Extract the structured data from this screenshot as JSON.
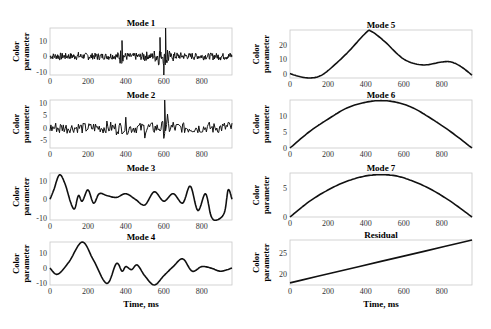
{
  "figure": {
    "xlabel": "Time, ms",
    "ylabel_line1": "Color",
    "ylabel_line2": "parameter",
    "xticks": [
      "0",
      "200",
      "400",
      "600",
      "800"
    ]
  },
  "chart_data": [
    {
      "type": "line",
      "title": "Mode 1",
      "xlabel": "",
      "ylabel": "Color parameter",
      "xlim": [
        0,
        960
      ],
      "ylim": [
        -12,
        18
      ],
      "yticks": [
        -10,
        0,
        10
      ],
      "xticks": [
        0,
        200,
        400,
        600,
        800
      ],
      "description": "high-frequency oscillation around 0, spikes up to ~18 near 610 ms and down to ~-12 near 580-610 ms",
      "x": [
        0,
        50,
        100,
        150,
        200,
        250,
        300,
        350,
        380,
        400,
        450,
        500,
        550,
        580,
        600,
        610,
        650,
        700,
        750,
        800,
        850,
        900,
        950
      ],
      "y": [
        0,
        5,
        -3,
        4,
        -5,
        4,
        -4,
        3,
        10,
        -6,
        5,
        -7,
        6,
        12,
        -12,
        18,
        -6,
        4,
        -3,
        3,
        -4,
        4,
        2
      ]
    },
    {
      "type": "line",
      "title": "Mode 2",
      "xlabel": "",
      "ylabel": "Color parameter",
      "xlim": [
        0,
        960
      ],
      "ylim": [
        -8,
        11
      ],
      "yticks": [
        -5,
        0,
        5,
        10
      ],
      "xticks": [
        0,
        200,
        400,
        600,
        800
      ],
      "description": "medium-frequency oscillation, amplitude ~5, spike to ~11 at 605 ms",
      "x": [
        0,
        50,
        100,
        150,
        200,
        250,
        300,
        350,
        400,
        450,
        500,
        550,
        600,
        605,
        620,
        650,
        700,
        750,
        800,
        850,
        900,
        940,
        960
      ],
      "y": [
        0,
        5,
        -2,
        2,
        -3,
        3,
        -4,
        5,
        -6,
        5,
        -6,
        4,
        -6,
        11,
        -8,
        5,
        -4,
        2,
        -3,
        3,
        -1,
        6,
        0
      ]
    },
    {
      "type": "line",
      "title": "Mode 3",
      "xlabel": "",
      "ylabel": "Color parameter",
      "xlim": [
        0,
        960
      ],
      "ylim": [
        -11,
        14
      ],
      "yticks": [
        -10,
        0,
        10
      ],
      "xticks": [
        0,
        200,
        400,
        600,
        800
      ],
      "x": [
        0,
        20,
        50,
        80,
        110,
        130,
        150,
        170,
        200,
        230,
        260,
        300,
        350,
        400,
        450,
        500,
        550,
        600,
        650,
        700,
        740,
        780,
        820,
        850,
        880,
        920,
        940,
        960
      ],
      "y": [
        0,
        5,
        13,
        8,
        -2,
        -5,
        2,
        -1,
        5,
        -2,
        3,
        2,
        1,
        3,
        0,
        -3,
        4,
        -1,
        3,
        -2,
        7,
        -6,
        3,
        -9,
        -11,
        -7,
        5,
        0
      ]
    },
    {
      "type": "line",
      "title": "Mode 4",
      "xlabel": "Time, ms",
      "ylabel": "Color parameter",
      "xlim": [
        0,
        960
      ],
      "ylim": [
        -11,
        17
      ],
      "yticks": [
        -10,
        0,
        10
      ],
      "xticks": [
        0,
        200,
        400,
        600,
        800
      ],
      "x": [
        0,
        40,
        100,
        170,
        230,
        300,
        350,
        380,
        400,
        430,
        460,
        500,
        550,
        600,
        650,
        700,
        750,
        800,
        850,
        900,
        960
      ],
      "y": [
        0,
        -4,
        4,
        17,
        5,
        -10,
        3,
        -2,
        1,
        -1,
        2,
        -5,
        -11,
        -5,
        1,
        6,
        -2,
        1,
        0,
        -2,
        0
      ]
    },
    {
      "type": "line",
      "title": "Mode 5",
      "xlabel": "",
      "ylabel": "Color parameter",
      "xlim": [
        0,
        960
      ],
      "ylim": [
        -3,
        30
      ],
      "yticks": [
        0,
        10,
        20
      ],
      "xticks": [
        0,
        200,
        400,
        600,
        800
      ],
      "x": [
        0,
        50,
        100,
        150,
        200,
        300,
        400,
        430,
        500,
        600,
        700,
        800,
        850,
        900,
        960
      ],
      "y": [
        0,
        -2,
        -3,
        -2,
        2,
        14,
        28,
        29,
        22,
        10,
        6,
        8,
        8,
        5,
        -1
      ]
    },
    {
      "type": "line",
      "title": "Mode 6",
      "xlabel": "",
      "ylabel": "Color parameter",
      "xlim": [
        0,
        960
      ],
      "ylim": [
        0,
        15
      ],
      "yticks": [
        0,
        5,
        10
      ],
      "xticks": [
        0,
        200,
        400,
        600,
        800
      ],
      "x": [
        0,
        100,
        200,
        300,
        400,
        480,
        560,
        650,
        750,
        850,
        960
      ],
      "y": [
        0,
        5,
        9,
        12.5,
        14.3,
        14.8,
        14.3,
        12.5,
        9,
        5,
        0
      ]
    },
    {
      "type": "line",
      "title": "Mode 7",
      "xlabel": "",
      "ylabel": "Color parameter",
      "xlim": [
        0,
        960
      ],
      "ylim": [
        0,
        7.5
      ],
      "yticks": [
        0,
        5
      ],
      "xticks": [
        0,
        200,
        400,
        600,
        800
      ],
      "x": [
        0,
        100,
        200,
        300,
        400,
        480,
        560,
        650,
        750,
        850,
        960
      ],
      "y": [
        0,
        2.6,
        4.6,
        6.1,
        7.0,
        7.2,
        7.0,
        6.1,
        4.6,
        2.6,
        0
      ]
    },
    {
      "type": "line",
      "title": "Residual",
      "xlabel": "Time, ms",
      "ylabel": "Color parameter",
      "xlim": [
        0,
        960
      ],
      "ylim": [
        17.5,
        28
      ],
      "yticks": [
        20,
        25
      ],
      "xticks": [
        0,
        200,
        400,
        600,
        800
      ],
      "x": [
        0,
        960
      ],
      "y": [
        18,
        28
      ]
    }
  ]
}
